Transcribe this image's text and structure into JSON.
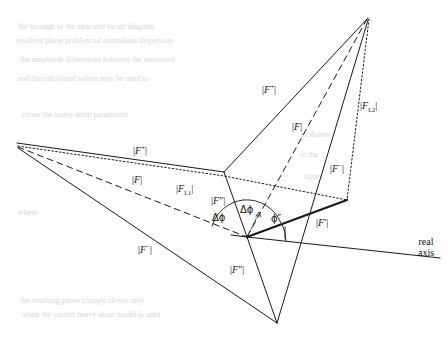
{
  "figure": {
    "type": "vector-phase-diagram",
    "real_axis_label_line1": "real",
    "real_axis_label_line2": "axis",
    "labels": [
      {
        "id": "f-plus-right",
        "text": "|F⁺|",
        "x": 262,
        "y": 84,
        "name": "label-f-plus-right"
      },
      {
        "id": "f-mod-right",
        "text": "|F|",
        "x": 292,
        "y": 122,
        "name": "label-f-right"
      },
      {
        "id": "f-minus-right",
        "text": "|F⁻|",
        "x": 330,
        "y": 163,
        "name": "label-f-minus-right"
      },
      {
        "id": "f-l2",
        "text": "|F_L2|",
        "x": 360,
        "y": 101,
        "name": "label-f-l2"
      },
      {
        "id": "f-plus-left",
        "text": "|F⁺|",
        "x": 133,
        "y": 145,
        "name": "label-f-plus-left"
      },
      {
        "id": "f-mod-left",
        "text": "|F|",
        "x": 132,
        "y": 175,
        "name": "label-f-left"
      },
      {
        "id": "f-l1",
        "text": "|F_L1|",
        "x": 176,
        "y": 184,
        "name": "label-f-l1"
      },
      {
        "id": "f-minus-left",
        "text": "|F⁻|",
        "x": 138,
        "y": 244,
        "name": "label-f-minus-left"
      },
      {
        "id": "f-dprime-up",
        "text": "|F″|",
        "x": 211,
        "y": 196,
        "name": "label-f-dprime-upper"
      },
      {
        "id": "f-dprime-low",
        "text": "|F″|",
        "x": 230,
        "y": 265,
        "name": "label-f-dprime-lower"
      },
      {
        "id": "f-prime",
        "text": "|F′|",
        "x": 316,
        "y": 218,
        "name": "label-f-prime"
      },
      {
        "id": "dphi-left",
        "text": "Δϕ",
        "x": 212,
        "y": 213,
        "name": "label-delta-phi-left"
      },
      {
        "id": "dphi-right",
        "text": "Δϕ",
        "x": 240,
        "y": 205,
        "name": "label-delta-phi-right"
      },
      {
        "id": "phi-dprime",
        "text": "ϕ″",
        "x": 271,
        "y": 214,
        "name": "label-phi-dprime"
      }
    ],
    "vertices": {
      "origin": {
        "x": 247,
        "y": 237
      },
      "apex_top": {
        "x": 368,
        "y": 18
      },
      "vertex_left": {
        "x": 17,
        "y": 143
      },
      "vertex_bot": {
        "x": 277,
        "y": 323
      },
      "mid_upper": {
        "x": 224,
        "y": 172
      },
      "f_prime_tip": {
        "x": 347,
        "y": 200
      },
      "axis_end": {
        "x": 440,
        "y": 258
      }
    },
    "colors": {
      "stroke": "#1a1a1a",
      "background": "#fefefe",
      "bleed_text": "#dcdcdc"
    },
    "line_styles": [
      "solid",
      "dashed",
      "dotted",
      "bold-solid"
    ]
  },
  "bleed_through": {
    "header": "",
    "rows": [
      {
        "x": 18,
        "y": 22,
        "text": "the through  of the  structure  factor  diagram"
      },
      {
        "x": 16,
        "y": 36,
        "text": "resolved  phase  problem  of  anomalous  dispersion"
      },
      {
        "x": 20,
        "y": 55,
        "text": "the  amplitude  differences  between  the  measured"
      },
      {
        "x": 18,
        "y": 74,
        "text": "and  the  calculated  values  may  be  used  to"
      },
      {
        "x": 22,
        "y": 110,
        "text": "refine   the   heavy   atom   parameters"
      },
      {
        "x": 300,
        "y": 130,
        "text": "as  shown"
      },
      {
        "x": 300,
        "y": 150,
        "text": "in  the"
      },
      {
        "x": 304,
        "y": 172,
        "text": "figure"
      },
      {
        "x": 18,
        "y": 208,
        "text": "where"
      },
      {
        "x": 20,
        "y": 296,
        "text": "the  resulting  phase  triangle  closes  only"
      },
      {
        "x": 22,
        "y": 310,
        "text": "when  the  correct  heavy  atom  model  is  used"
      }
    ]
  }
}
